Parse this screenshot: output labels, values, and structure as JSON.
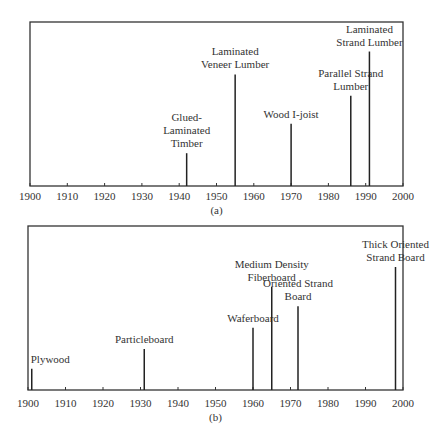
{
  "chart_data": [
    {
      "type": "timeline",
      "panel": "(a)",
      "title": "",
      "xlabel": "",
      "ylabel": "",
      "xlim": [
        1900,
        2000
      ],
      "xticks": [
        1900,
        1910,
        1920,
        1930,
        1940,
        1950,
        1960,
        1970,
        1980,
        1990,
        2000
      ],
      "events": [
        {
          "year": 1942,
          "label": [
            "Glued-",
            "Laminated",
            "Timber"
          ],
          "height": 0.2
        },
        {
          "year": 1955,
          "label": [
            "Laminated",
            "Veneer Lumber"
          ],
          "height": 0.68
        },
        {
          "year": 1970,
          "label": [
            "Wood I-joist"
          ],
          "height": 0.38
        },
        {
          "year": 1986,
          "label": [
            "Parallel Strand",
            "Lumber"
          ],
          "height": 0.55
        },
        {
          "year": 1991,
          "label": [
            "Laminated",
            "Strand Lumber"
          ],
          "height": 0.82
        }
      ]
    },
    {
      "type": "timeline",
      "panel": "(b)",
      "title": "",
      "xlabel": "",
      "ylabel": "",
      "xlim": [
        1900,
        2000
      ],
      "xticks": [
        1900,
        1910,
        1920,
        1930,
        1940,
        1950,
        1960,
        1970,
        1980,
        1990,
        2000
      ],
      "events": [
        {
          "year": 1901,
          "label": [
            "Plywood"
          ],
          "height": 0.13
        },
        {
          "year": 1931,
          "label": [
            "Particleboard"
          ],
          "height": 0.25
        },
        {
          "year": 1960,
          "label": [
            "Waferboard"
          ],
          "height": 0.38
        },
        {
          "year": 1965,
          "label": [
            "Medium Density",
            "Fiberboard"
          ],
          "height": 0.63
        },
        {
          "year": 1972,
          "label": [
            "Oriented Strand",
            "Board"
          ],
          "height": 0.51
        },
        {
          "year": 1998,
          "label": [
            "Thick Oriented",
            "Strand Board"
          ],
          "height": 0.75
        }
      ]
    }
  ]
}
